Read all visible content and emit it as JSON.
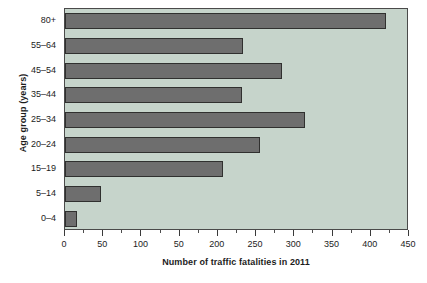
{
  "chart_data": {
    "type": "bar",
    "orientation": "horizontal",
    "title": "",
    "xlabel": "Number of traffic fatalities in 2011",
    "ylabel": "Age group (years)",
    "categories": [
      "0–4",
      "5–14",
      "15–19",
      "20–24",
      "25–34",
      "35–44",
      "45–54",
      "55–64",
      "80+"
    ],
    "values": [
      16,
      47,
      207,
      255,
      314,
      232,
      284,
      233,
      420
    ],
    "xlim": [
      0,
      450
    ],
    "xticks": [
      0,
      50,
      100,
      150,
      200,
      250,
      300,
      350,
      400,
      450
    ],
    "xticklabels": [
      "0",
      "50",
      "100",
      "50",
      "200",
      "250",
      "300",
      "350",
      "400",
      "450"
    ],
    "minor_tick_interval": 25,
    "grid": false,
    "legend": null,
    "bar_color": "#6e6e6e",
    "bar_edge_color": "#30302f",
    "plot_background": "#c6d4cb",
    "axis_color": "#4a4a4a",
    "text_color": "#1c1c1c"
  }
}
